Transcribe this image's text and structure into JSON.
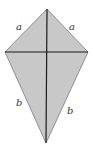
{
  "diagram": {
    "type": "kite",
    "fill_color": "#c8c8c8",
    "stroke_color": "#1a1a1a",
    "vertices": {
      "top": [
        47,
        9
      ],
      "left": [
        5,
        52
      ],
      "right": [
        88,
        52
      ],
      "bottom": [
        46,
        143
      ]
    },
    "labels": {
      "upper_left": "a",
      "upper_right": "a",
      "lower_left": "b",
      "lower_right": "b"
    }
  }
}
